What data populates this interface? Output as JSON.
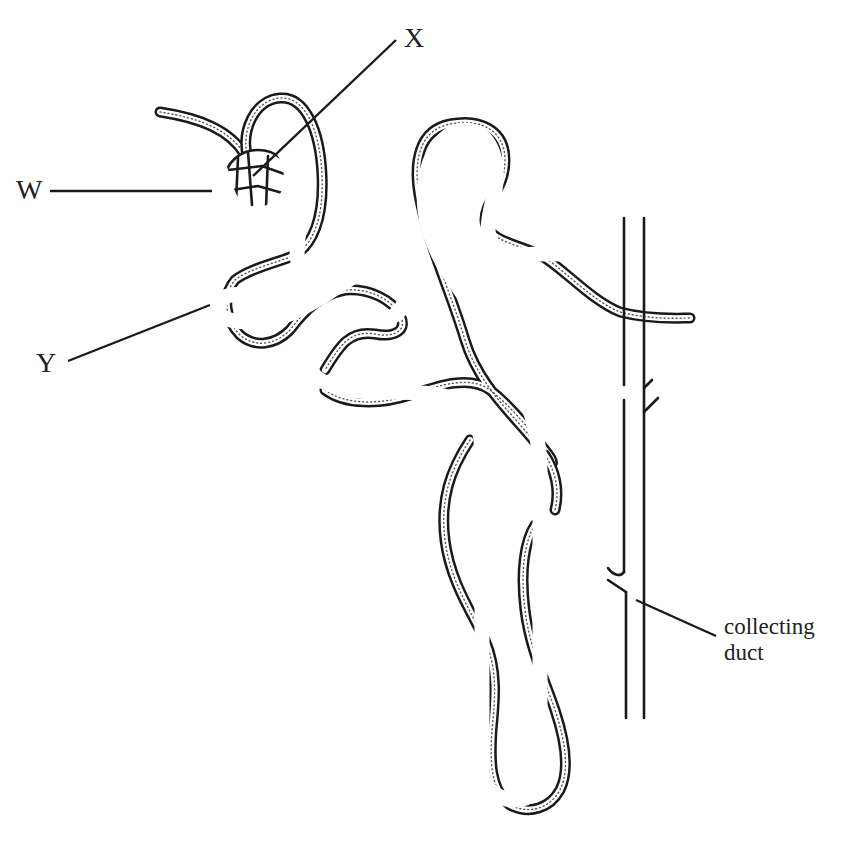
{
  "diagram": {
    "labels": {
      "w": "W",
      "x": "X",
      "y": "Y",
      "collecting_duct_line1": "collecting",
      "collecting_duct_line2": "duct"
    },
    "colors": {
      "line": "#1a1a1a",
      "background": "#ffffff",
      "stipple": "#555555"
    }
  }
}
